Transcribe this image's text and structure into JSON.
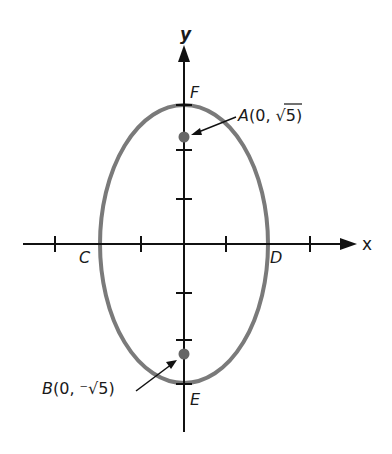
{
  "figure": {
    "axes": {
      "x_label": "x",
      "y_label": "y"
    },
    "points": {
      "A": {
        "label": "A(0, √5)",
        "name": "A",
        "coord_prefix": "(0, ",
        "radical": "√5",
        "suffix": ")"
      },
      "B": {
        "label": "B(0, −√5)",
        "name": "B",
        "coord_prefix": "(0, ",
        "neg": "⁻",
        "radical": "√5",
        "suffix": ")"
      },
      "C": {
        "label": "C"
      },
      "D": {
        "label": "D"
      },
      "E": {
        "label": "E"
      },
      "F": {
        "label": "F"
      }
    },
    "colors": {
      "ellipse": "#7a7a7a",
      "axis": "#111111",
      "dot": "#666666"
    }
  }
}
